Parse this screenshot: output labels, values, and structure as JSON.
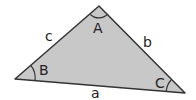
{
  "diagram": {
    "type": "triangle",
    "fill_color": "#c8c8c8",
    "stroke_color": "#333333",
    "vertices": {
      "A": {
        "label": "A",
        "x": 99,
        "y": 6
      },
      "B": {
        "label": "B",
        "x": 15,
        "y": 79
      },
      "C": {
        "label": "C",
        "x": 185,
        "y": 93
      }
    },
    "sides": {
      "a": {
        "label": "a",
        "between": [
          "B",
          "C"
        ]
      },
      "b": {
        "label": "b",
        "between": [
          "A",
          "C"
        ]
      },
      "c": {
        "label": "c",
        "between": [
          "A",
          "B"
        ]
      }
    },
    "angle_labels": [
      "A",
      "B",
      "C"
    ]
  }
}
